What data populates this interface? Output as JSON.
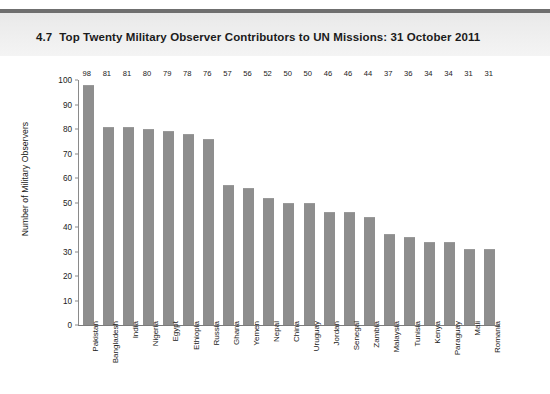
{
  "header": {
    "figure_number": "4.7",
    "title": "Top Twenty Military Observer Contributors to UN Missions: 31 October 2011"
  },
  "colors": {
    "bar": "#8e8e8e",
    "header_band": "#eeeeee",
    "header_rule": "#6f6f6f",
    "axis": "#8a8a8a",
    "text": "#1a1a1a"
  },
  "chart_data": {
    "type": "bar",
    "title": "Top Twenty Military Observer Contributors to UN Missions: 31 October 2011",
    "xlabel": "",
    "ylabel": "Number of Military Observers",
    "ylim": [
      0,
      100
    ],
    "yticks": [
      0,
      10,
      20,
      30,
      40,
      50,
      60,
      70,
      80,
      90,
      100
    ],
    "grid": false,
    "legend": null,
    "categories": [
      "Pakistan",
      "Bangladesh",
      "India",
      "Nigeria",
      "Egypt",
      "Ethiopia",
      "Russia",
      "Ghana",
      "Yemen",
      "Nepal",
      "China",
      "Uruguay",
      "Jordan",
      "Senegal",
      "Zambia",
      "Malaysia",
      "Tunisia",
      "Kenya",
      "Paraguay",
      "Mali",
      "Romania"
    ],
    "values": [
      98,
      81,
      81,
      80,
      79,
      78,
      76,
      57,
      56,
      52,
      50,
      50,
      46,
      46,
      44,
      37,
      36,
      34,
      34,
      31,
      31
    ]
  }
}
